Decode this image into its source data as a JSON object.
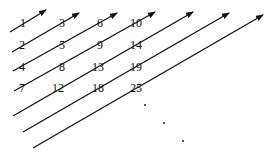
{
  "diagram": {
    "line_color": "#111111",
    "arrows": [
      {
        "x1": 10,
        "y1": 32,
        "x2": 46,
        "y2": 10
      },
      {
        "x1": 12,
        "y1": 52,
        "x2": 79,
        "y2": 13
      },
      {
        "x1": 13,
        "y1": 71,
        "x2": 117,
        "y2": 13
      },
      {
        "x1": 14,
        "y1": 91,
        "x2": 155,
        "y2": 12
      },
      {
        "x1": 13,
        "y1": 116,
        "x2": 193,
        "y2": 12
      },
      {
        "x1": 23,
        "y1": 132,
        "x2": 229,
        "y2": 13
      },
      {
        "x1": 33,
        "y1": 148,
        "x2": 263,
        "y2": 15
      }
    ],
    "labels": [
      {
        "text": "1",
        "x": 23,
        "y": 23
      },
      {
        "text": "3",
        "x": 62,
        "y": 23
      },
      {
        "text": "6",
        "x": 100,
        "y": 23
      },
      {
        "text": "10",
        "x": 136,
        "y": 23
      },
      {
        "text": "2",
        "x": 22,
        "y": 45
      },
      {
        "text": "5",
        "x": 62,
        "y": 45
      },
      {
        "text": "9",
        "x": 100,
        "y": 45
      },
      {
        "text": "14",
        "x": 136,
        "y": 45
      },
      {
        "text": "4",
        "x": 22,
        "y": 67
      },
      {
        "text": "8",
        "x": 62,
        "y": 67
      },
      {
        "text": "13",
        "x": 98,
        "y": 67
      },
      {
        "text": "19",
        "x": 136,
        "y": 67
      },
      {
        "text": "7",
        "x": 22,
        "y": 88
      },
      {
        "text": "12",
        "x": 58,
        "y": 88
      },
      {
        "text": "18",
        "x": 98,
        "y": 88
      },
      {
        "text": "25",
        "x": 136,
        "y": 88
      }
    ],
    "dots": [
      {
        "x": 145,
        "y": 105
      },
      {
        "x": 164,
        "y": 123
      },
      {
        "x": 183,
        "y": 141
      }
    ]
  }
}
